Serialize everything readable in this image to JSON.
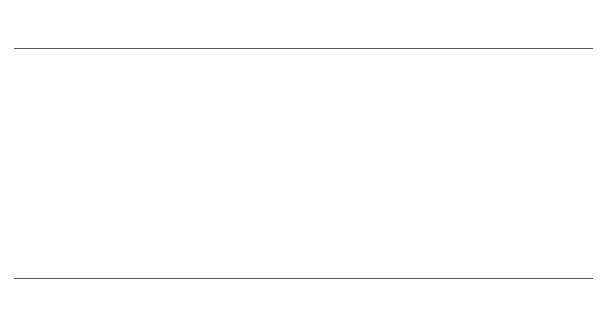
{
  "diagram": {
    "background_color": "#ffffff",
    "line_color": "#555555",
    "band_color": "#111111"
  },
  "chart_data": {
    "type": "scatter",
    "xlabel": "",
    "ylabel": "",
    "scales": [
      {
        "id": "top-scale",
        "orientation": "horizontal",
        "scale_type": "logarithmic",
        "unit_above": "mm",
        "unit_below": "m",
        "range_mm": [
          100,
          1500
        ],
        "ticks": [
          {
            "mm": "100",
            "m": "0·1",
            "x": 14
          },
          {
            "mm": "200",
            "m": "0·2",
            "x": 168
          },
          {
            "mm": "300",
            "m": "0·3",
            "x": 257
          },
          {
            "mm": "400",
            "m": "0·4",
            "x": 320
          },
          {
            "mm": "500",
            "m": "0·5",
            "x": 369
          },
          {
            "mm": "600",
            "m": "0·6",
            "x": 409
          },
          {
            "mm": "700",
            "m": "0·7",
            "x": 443
          },
          {
            "mm": "800",
            "m": "0·8",
            "x": 472
          },
          {
            "mm": "900",
            "m": "0·9",
            "x": 498
          },
          {
            "mm": "1000",
            "m": "1",
            "x": 521
          },
          {
            "mm": "",
            "m": "1·1",
            "x": 541
          },
          {
            "mm": "",
            "m": "1·2",
            "x": 557
          },
          {
            "mm": "",
            "m": "1·3",
            "x": 571
          },
          {
            "mm": "",
            "m": "1·4",
            "x": 583
          },
          {
            "mm": "",
            "m": "1·5",
            "x": 593
          }
        ]
      },
      {
        "id": "middle-scale",
        "orientation": "horizontal",
        "scale_type": "logarithmic",
        "unit_above": "mm²",
        "range_mm2": [
          100,
          20000
        ],
        "ticks": [
          {
            "label": "100",
            "x": 14
          },
          {
            "label": "300",
            "x": 137
          },
          {
            "label": "1000",
            "x": 260
          },
          {
            "label": "2500",
            "x": 348
          },
          {
            "label": "10 000",
            "x": 502
          }
        ],
        "bands": [
          {
            "number": "1",
            "style": "thick",
            "x_start": 14,
            "x_end": 137,
            "caption": "Not exceeding 0·03 m²",
            "caption_x": 75,
            "circle_x": 72
          },
          {
            "number": "2",
            "style": "thin",
            "x_start": 137,
            "x_end": 260,
            "caption": "0·03–0·1 m²",
            "caption_x": 200,
            "circle_x": 204
          },
          {
            "number": "3",
            "style": "thick",
            "x_start": 260,
            "x_end": 348,
            "caption": "0·1–0·25 m²",
            "caption_x": 300,
            "circle_x": 302
          },
          {
            "number": "4",
            "style": "thin",
            "x_start": 348,
            "x_end": 502,
            "caption": "0·25–1 m²",
            "caption_x": 430,
            "circle_x": 430
          },
          {
            "number": "5",
            "style": "thick",
            "x_start": 502,
            "x_end": 593,
            "caption": "Exceeding  1 m²",
            "caption_x": 549,
            "circle_x": 536
          }
        ]
      },
      {
        "id": "bottom-scale",
        "orientation": "horizontal",
        "scale_type": "logarithmic",
        "unit_above": "m",
        "unit_below": "mm",
        "range_mm": [
          100,
          1500
        ],
        "ticks": [
          {
            "m": "0·1",
            "mm": "100",
            "x": 14
          },
          {
            "m": "0·2",
            "mm": "200",
            "x": 168
          },
          {
            "m": "0·3",
            "mm": "300",
            "x": 257
          },
          {
            "m": "0·4",
            "mm": "400",
            "x": 320
          },
          {
            "m": "0·5",
            "mm": "500",
            "x": 369
          },
          {
            "m": "0·6",
            "mm": "600",
            "x": 409
          },
          {
            "m": "0·7",
            "mm": "700",
            "x": 443
          },
          {
            "m": "0·8",
            "mm": "800",
            "x": 472
          },
          {
            "m": "0·9",
            "mm": "900",
            "x": 498
          },
          {
            "m": "1·0",
            "mm": "1000",
            "x": 521
          },
          {
            "m": "1·1",
            "mm": "",
            "x": 541
          },
          {
            "m": "1·2",
            "mm": "",
            "x": 557
          },
          {
            "m": "1·3",
            "mm": "",
            "x": 571
          },
          {
            "m": "1·4",
            "mm": "",
            "x": 583
          },
          {
            "m": "1·5",
            "mm": "",
            "x": 593
          }
        ]
      }
    ]
  }
}
